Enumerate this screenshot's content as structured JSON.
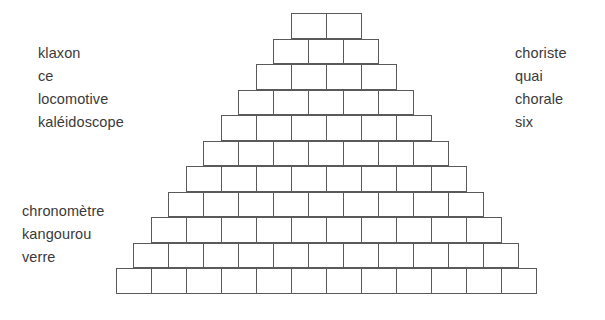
{
  "page": {
    "background_color": "#ffffff",
    "text_color": "#3a3a3a",
    "line_color": "#5a5a5a"
  },
  "word_lists": {
    "top_left": {
      "name": "top-left-word-list",
      "words": [
        "klaxon",
        "ce",
        "locomotive",
        "kaléidoscope"
      ]
    },
    "top_right": {
      "name": "top-right-word-list",
      "words": [
        "choriste",
        "quai",
        "chorale",
        "six"
      ]
    },
    "bottom_left": {
      "name": "bottom-left-word-list",
      "words": [
        "chronomètre",
        "kangourou",
        "verre"
      ]
    }
  },
  "pyramid": {
    "name": "word-pyramid",
    "rows": 11,
    "top_row_cells": 2,
    "bottom_row_cells": 12,
    "cell_counts": [
      2,
      3,
      4,
      5,
      6,
      7,
      8,
      9,
      10,
      11,
      12
    ],
    "cell_width": 36,
    "cell_height": 25.5,
    "top_y": 13,
    "bottom_y": 293,
    "center_x": 326,
    "cells_total": 77
  }
}
